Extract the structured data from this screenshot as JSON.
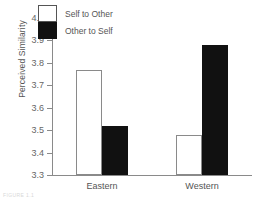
{
  "chart_data": {
    "type": "bar",
    "title": "",
    "xlabel": "",
    "ylabel": "Perceived Similarity",
    "categories": [
      "Eastern",
      "Western"
    ],
    "series": [
      {
        "name": "Self to Other",
        "values": [
          3.77,
          3.48
        ],
        "style": "open",
        "color": "#ffffff"
      },
      {
        "name": "Other to Self",
        "values": [
          3.52,
          3.88
        ],
        "style": "filled",
        "color": "#111111"
      }
    ],
    "ylim": [
      3.3,
      4.0
    ],
    "ytick_step": 0.1,
    "yticks": [
      "4.0",
      "3.9",
      "3.8",
      "3.7",
      "3.6",
      "3.5",
      "3.4",
      "3.3"
    ],
    "ytick_values": [
      4.0,
      3.9,
      3.8,
      3.7,
      3.6,
      3.5,
      3.4,
      3.3
    ],
    "grid": false,
    "legend_position": "top-left-inside"
  },
  "axes": {
    "y_title": "Perceived Similarity"
  },
  "legend": {
    "entries": [
      {
        "label": "Self to Other",
        "swatch": "open-square-icon"
      },
      {
        "label": "Other to Self",
        "swatch": "filled-square-icon"
      }
    ]
  },
  "caption": {
    "remnant": "FIGURE 1.1"
  }
}
